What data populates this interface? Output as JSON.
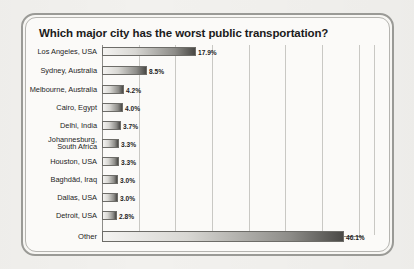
{
  "chart": {
    "title": "Which major city has the worst public transportation?",
    "value_suffix": "%"
  },
  "chart_data": {
    "type": "bar",
    "orientation": "horizontal",
    "title": "Which major city has the worst public transportation?",
    "xlabel": "",
    "ylabel": "",
    "xlim": [
      0,
      50
    ],
    "grid": true,
    "legend": null,
    "categories": [
      "Los Angeles, USA",
      "Sydney, Australia",
      "Melbourne, Australia",
      "Cairo, Egypt",
      "Delhi, India",
      "Johannesburg, South Africa",
      "Houston, USA",
      "Baghdād, Iraq",
      "Dallas, USA",
      "Detroit, USA",
      "Other"
    ],
    "values": [
      17.9,
      8.5,
      4.2,
      4.0,
      3.7,
      3.3,
      3.3,
      3.0,
      3.0,
      2.8,
      46.1
    ],
    "value_labels": [
      "17.9%",
      "8.5%",
      "4.2%",
      "4.0%",
      "3.7%",
      "3.3%",
      "3.3%",
      "3.0%",
      "3.0%",
      "2.8%",
      "46.1%"
    ],
    "gridline_values": [
      7,
      14,
      21,
      28,
      35,
      42,
      49,
      52
    ],
    "bars": [
      {
        "label": "Los Angeles, USA",
        "value": 17.9,
        "value_label": "17.9%",
        "label_lines": [
          "Los Angeles, USA"
        ]
      },
      {
        "label": "Sydney, Australia",
        "value": 8.5,
        "value_label": "8.5%",
        "label_lines": [
          "Sydney, Australia"
        ]
      },
      {
        "label": "Melbourne, Australia",
        "value": 4.2,
        "value_label": "4.2%",
        "label_lines": [
          "Melbourne, Australia"
        ]
      },
      {
        "label": "Cairo, Egypt",
        "value": 4.0,
        "value_label": "4.0%",
        "label_lines": [
          "Cairo, Egypt"
        ]
      },
      {
        "label": "Delhi, India",
        "value": 3.7,
        "value_label": "3.7%",
        "label_lines": [
          "Delhi, India"
        ]
      },
      {
        "label": "Johannesburg, South Africa",
        "value": 3.3,
        "value_label": "3.3%",
        "label_lines": [
          "Johannesburg,",
          "South Africa"
        ]
      },
      {
        "label": "Houston, USA",
        "value": 3.3,
        "value_label": "3.3%",
        "label_lines": [
          "Houston, USA"
        ]
      },
      {
        "label": "Baghdād, Iraq",
        "value": 3.0,
        "value_label": "3.0%",
        "label_lines": [
          "Baghdād, Iraq"
        ]
      },
      {
        "label": "Dallas, USA",
        "value": 3.0,
        "value_label": "3.0%",
        "label_lines": [
          "Dallas, USA"
        ]
      },
      {
        "label": "Detroit, USA",
        "value": 2.8,
        "value_label": "2.8%",
        "label_lines": [
          "Detroit, USA"
        ]
      },
      {
        "label": "Other",
        "value": 46.1,
        "value_label": "46.1%",
        "label_lines": [
          "Other"
        ]
      }
    ]
  },
  "style": {
    "page_background": "#f2f1ee",
    "panel_background": "#fbfaf8",
    "frame_color": "#9a9a96",
    "gridline_color": "#c9c8c4",
    "bar_light": "#f4f3f1",
    "bar_dark": "#4a4946",
    "text_color": "#1d1d1d"
  }
}
